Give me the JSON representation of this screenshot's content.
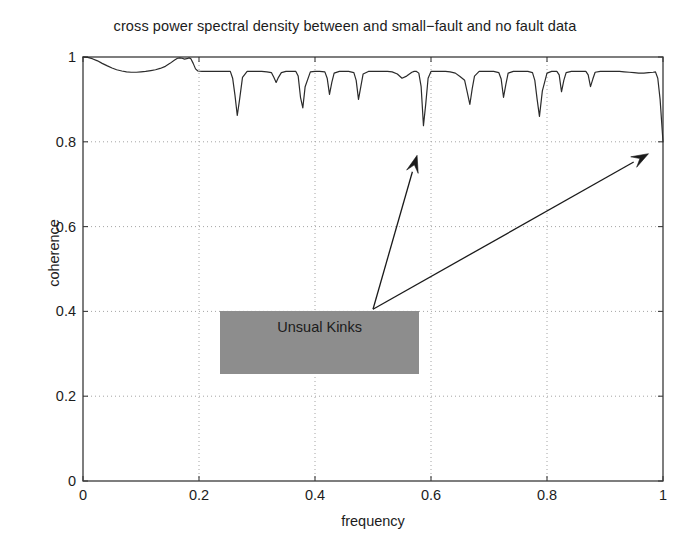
{
  "chart_data": {
    "type": "line",
    "title": "cross power spectral density between and small−fault and no fault data",
    "xlabel": "frequency",
    "ylabel": "coherence",
    "xlim": [
      0,
      1
    ],
    "ylim": [
      0,
      1
    ],
    "grid": "dotted",
    "xticks": [
      "0",
      "0.2",
      "0.4",
      "0.6",
      "0.8",
      "1"
    ],
    "xtick_values": [
      0,
      0.2,
      0.4,
      0.6,
      0.8,
      1
    ],
    "yticks": [
      "0",
      "0.2",
      "0.4",
      "0.6",
      "0.8",
      "1"
    ],
    "ytick_values": [
      0,
      0.2,
      0.4,
      0.6,
      0.8,
      1
    ],
    "legend": null,
    "series": [
      {
        "name": "coherence",
        "color": "#2b2b2b",
        "x": [
          0.0,
          0.008,
          0.016,
          0.025,
          0.033,
          0.042,
          0.05,
          0.058,
          0.067,
          0.075,
          0.083,
          0.092,
          0.1,
          0.108,
          0.117,
          0.125,
          0.133,
          0.142,
          0.15,
          0.158,
          0.163,
          0.167,
          0.171,
          0.175,
          0.179,
          0.183,
          0.186,
          0.19,
          0.194,
          0.198,
          0.205,
          0.213,
          0.221,
          0.229,
          0.238,
          0.246,
          0.254,
          0.258,
          0.262,
          0.266,
          0.27,
          0.275,
          0.283,
          0.292,
          0.3,
          0.308,
          0.317,
          0.325,
          0.329,
          0.333,
          0.337,
          0.342,
          0.35,
          0.358,
          0.367,
          0.371,
          0.375,
          0.379,
          0.383,
          0.392,
          0.4,
          0.408,
          0.417,
          0.421,
          0.425,
          0.429,
          0.433,
          0.442,
          0.45,
          0.458,
          0.467,
          0.471,
          0.475,
          0.479,
          0.483,
          0.492,
          0.5,
          0.508,
          0.517,
          0.525,
          0.533,
          0.542,
          0.55,
          0.558,
          0.567,
          0.571,
          0.575,
          0.579,
          0.583,
          0.587,
          0.591,
          0.595,
          0.6,
          0.608,
          0.617,
          0.625,
          0.633,
          0.642,
          0.65,
          0.658,
          0.662,
          0.667,
          0.671,
          0.675,
          0.683,
          0.692,
          0.7,
          0.708,
          0.717,
          0.721,
          0.725,
          0.729,
          0.733,
          0.742,
          0.75,
          0.758,
          0.767,
          0.775,
          0.779,
          0.783,
          0.787,
          0.792,
          0.8,
          0.808,
          0.817,
          0.821,
          0.825,
          0.829,
          0.833,
          0.842,
          0.85,
          0.858,
          0.867,
          0.871,
          0.875,
          0.879,
          0.883,
          0.892,
          0.9,
          0.908,
          0.917,
          0.925,
          0.933,
          0.942,
          0.95,
          0.958,
          0.967,
          0.975,
          0.983,
          0.987,
          0.991,
          0.995,
          1.0
        ],
        "y": [
          1.0,
          0.999,
          0.996,
          0.991,
          0.985,
          0.979,
          0.974,
          0.97,
          0.967,
          0.965,
          0.964,
          0.964,
          0.965,
          0.966,
          0.968,
          0.97,
          0.973,
          0.978,
          0.985,
          0.993,
          0.997,
          0.998,
          0.997,
          0.995,
          0.996,
          0.998,
          0.996,
          0.985,
          0.972,
          0.967,
          0.966,
          0.966,
          0.966,
          0.966,
          0.966,
          0.966,
          0.966,
          0.95,
          0.91,
          0.862,
          0.9,
          0.952,
          0.966,
          0.966,
          0.966,
          0.966,
          0.965,
          0.963,
          0.952,
          0.94,
          0.952,
          0.963,
          0.966,
          0.966,
          0.966,
          0.955,
          0.905,
          0.88,
          0.93,
          0.965,
          0.966,
          0.966,
          0.965,
          0.95,
          0.912,
          0.94,
          0.962,
          0.966,
          0.966,
          0.966,
          0.963,
          0.945,
          0.9,
          0.93,
          0.96,
          0.966,
          0.966,
          0.966,
          0.966,
          0.966,
          0.965,
          0.96,
          0.95,
          0.955,
          0.964,
          0.966,
          0.966,
          0.962,
          0.93,
          0.838,
          0.89,
          0.95,
          0.966,
          0.966,
          0.966,
          0.966,
          0.965,
          0.962,
          0.954,
          0.945,
          0.92,
          0.888,
          0.925,
          0.955,
          0.966,
          0.966,
          0.966,
          0.966,
          0.963,
          0.948,
          0.905,
          0.935,
          0.962,
          0.966,
          0.966,
          0.966,
          0.966,
          0.963,
          0.945,
          0.9,
          0.86,
          0.92,
          0.962,
          0.966,
          0.966,
          0.958,
          0.918,
          0.945,
          0.963,
          0.966,
          0.966,
          0.966,
          0.966,
          0.958,
          0.93,
          0.948,
          0.964,
          0.966,
          0.966,
          0.966,
          0.966,
          0.966,
          0.965,
          0.964,
          0.963,
          0.962,
          0.962,
          0.963,
          0.964,
          0.965,
          0.95,
          0.9,
          0.8
        ]
      }
    ],
    "annotations": [
      {
        "name": "unusual-kinks-callout",
        "text": "Unsual Kinks",
        "box_fill": "#8d8d8d",
        "box_x": [
          0.236,
          0.58
        ],
        "box_y": [
          0.253,
          0.4
        ],
        "arrows": [
          {
            "from": [
              0.5,
              0.405
            ],
            "to": [
              0.576,
              0.768
            ]
          },
          {
            "from": [
              0.5,
              0.405
            ],
            "to": [
              0.975,
              0.772
            ]
          }
        ]
      }
    ]
  },
  "axes": {
    "title": "cross power spectral density between and small−fault and no fault data",
    "x_label": "frequency",
    "y_label": "coherence",
    "x_tick_labels": [
      "0",
      "0.2",
      "0.4",
      "0.6",
      "0.8",
      "1"
    ],
    "y_tick_labels": [
      "0",
      "0.2",
      "0.4",
      "0.6",
      "0.8",
      "1"
    ]
  },
  "annotation": {
    "label": "Unsual Kinks"
  },
  "colors": {
    "background": "#ffffff",
    "axis": "#3a3a3a",
    "grid": "#9a9a9a",
    "curve": "#2b2b2b",
    "annotation_box": "#8d8d8d",
    "text": "#1c1c1c"
  }
}
